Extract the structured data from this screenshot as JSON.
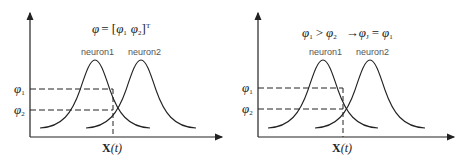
{
  "panels": [
    {
      "title_formula": "φ = [φ1 φ2]^T",
      "curve_labels": [
        "neuron1",
        "neuron2"
      ],
      "y_labels": [
        "φ1",
        "φ2"
      ],
      "x_label": "X(t)"
    },
    {
      "title_formula": "φ1 > φ2 → φJ = φ1",
      "curve_labels": [
        "neuron1",
        "neuron2"
      ],
      "y_labels": [
        "φ1",
        "φ2"
      ],
      "x_label": "X(t)"
    }
  ],
  "text": {
    "p1_phi": "φ",
    "p1_eq": "= [",
    "p1_phi1": "φ",
    "p1_sub1": "1",
    "p1_phi2": "φ",
    "p1_sub2": "2",
    "p1_close": "]",
    "p1_sup": "T",
    "p2_phi1": "φ",
    "p2_sub1": "1",
    "p2_gt": ">",
    "p2_phi2": "φ",
    "p2_sub2": "2",
    "p2_arrow": "→",
    "p2_phiJ": "φ",
    "p2_subJ": "J",
    "p2_eq": "=",
    "p2_phi3": "φ",
    "p2_sub3": "1",
    "neuron1": "neuron1",
    "neuron2": "neuron2",
    "ylab_phi": "φ",
    "ylab_sub1": "1",
    "ylab_sub2": "2",
    "x_bold": "X",
    "x_paren": "(t)"
  },
  "colors": {
    "line": "#222222",
    "label": "#555555",
    "background": "#ffffff"
  }
}
